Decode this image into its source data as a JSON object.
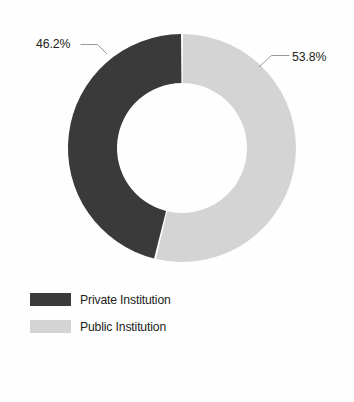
{
  "chart_data": {
    "type": "pie",
    "variant": "donut",
    "title": "",
    "subtitle": "",
    "xlabel": "",
    "ylabel": "",
    "grid": false,
    "legend_position": "bottom-left",
    "start_angle_deg": 0,
    "direction": "clockwise",
    "hole_fraction": 0.57,
    "categories": [
      "Private Institution",
      "Public Institution"
    ],
    "values": [
      46.2,
      53.8
    ],
    "value_unit": "%",
    "data_labels": [
      "46.2%",
      "53.8%"
    ],
    "colors": [
      "#3a3a3a",
      "#d4d4d4"
    ],
    "slices": [
      {
        "name": "Private Institution",
        "value": 46.2,
        "label": "46.2%",
        "color": "#3a3a3a",
        "start_deg": 193.68,
        "end_deg": 360.0
      },
      {
        "name": "Public Institution",
        "value": 53.8,
        "label": "53.8%",
        "color": "#d4d4d4",
        "start_deg": 0.0,
        "end_deg": 193.68
      }
    ]
  },
  "annotations": {
    "left": {
      "text": "46.2%",
      "x": 36,
      "y": 48
    },
    "right": {
      "text": "53.8%",
      "x": 292,
      "y": 61
    }
  },
  "legend": {
    "items": [
      {
        "label": "Private Institution",
        "color": "#3a3a3a"
      },
      {
        "label": "Public Institution",
        "color": "#d4d4d4"
      }
    ]
  },
  "geometry": {
    "center_x": 182,
    "center_y": 148,
    "outer_radius": 114,
    "inner_radius": 65
  },
  "palette": {
    "background": "#fefefe",
    "text": "#231f20",
    "leader_line": "#8c8c8c",
    "dark_slice": "#3a3a3a",
    "light_slice": "#d4d4d4"
  }
}
